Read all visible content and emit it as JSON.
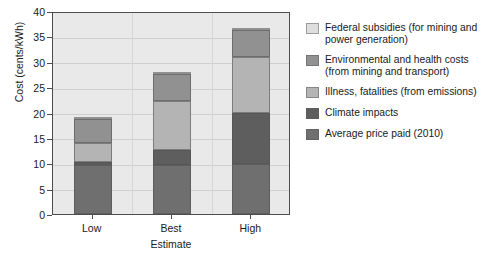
{
  "chart_data": {
    "type": "bar",
    "subtype": "stacked-column",
    "title": "",
    "xlabel": "Estimate",
    "ylabel": "Cost (cents/kWh)",
    "categories": [
      "Low",
      "Best",
      "High"
    ],
    "ylim": [
      0,
      40
    ],
    "yticks": [
      0,
      5,
      10,
      15,
      20,
      25,
      30,
      35,
      40
    ],
    "grid": true,
    "legend_position": "right",
    "stack_order_bottom_to_top": [
      "Average price paid (2010)",
      "Climate impacts",
      "Illness, fatalities (from emissions)",
      "Environmental and health costs (from mining and transport)",
      "Federal subsidies (for mining and power generation)"
    ],
    "series": [
      {
        "name": "Average price paid (2010)",
        "color": "#6f6f6f",
        "values": [
          9.6,
          9.6,
          9.8
        ]
      },
      {
        "name": "Climate impacts",
        "color": "#5e5e5e",
        "values": [
          0.7,
          3.1,
          10.1
        ]
      },
      {
        "name": "Illness, fatalities (from emissions)",
        "color": "#b4b4b4",
        "values": [
          3.7,
          9.6,
          11.1
        ]
      },
      {
        "name": "Environmental and health costs (from mining and transport)",
        "color": "#919191",
        "values": [
          4.8,
          5.3,
          5.3
        ]
      },
      {
        "name": "Federal subsidies (for mining and power generation)",
        "color": "#dedede",
        "values": [
          0.2,
          0.4,
          0.4
        ]
      }
    ],
    "totals": [
      18.8,
      28.0,
      36.7
    ]
  },
  "axes": {
    "y_title": "Cost (cents/kWh)",
    "x_title": "Estimate",
    "y_tick_labels": [
      "0",
      "5",
      "10",
      "15",
      "20",
      "25",
      "30",
      "35",
      "40"
    ],
    "x_tick_labels": [
      "Low",
      "Best",
      "High"
    ]
  },
  "legend": {
    "items": [
      {
        "label": "Federal subsidies (for mining and power generation)",
        "color": "#dedede"
      },
      {
        "label": "Environmental and health costs (from mining and transport)",
        "color": "#919191"
      },
      {
        "label": "Illness, fatalities (from emissions)",
        "color": "#b4b4b4"
      },
      {
        "label": "Climate impacts",
        "color": "#5e5e5e"
      },
      {
        "label": "Average price paid (2010)",
        "color": "#6f6f6f"
      }
    ]
  },
  "colors": {
    "plot_background": "#e9e9e9",
    "page_background": "#ffffff",
    "axis": "#4d4d4d",
    "gridline": "#cfcfcf",
    "text": "#1a1a1a"
  }
}
